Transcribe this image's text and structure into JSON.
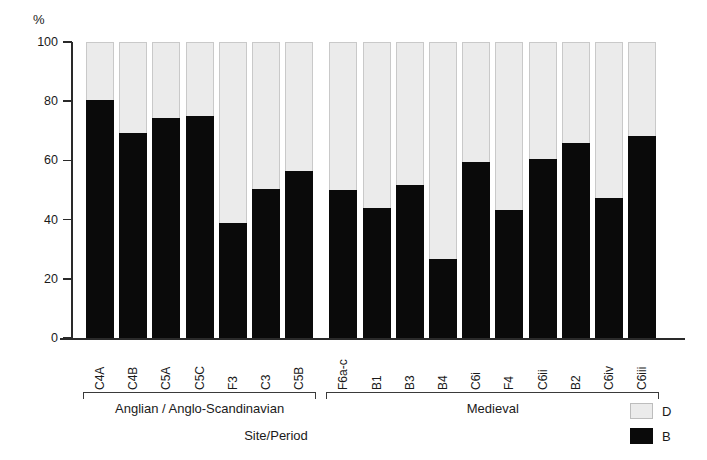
{
  "chart_data": {
    "type": "bar",
    "subtype": "stacked-percentage",
    "title": "",
    "xlabel": "Site/Period",
    "ylabel": "%",
    "ylim": [
      0,
      100
    ],
    "yticks": [
      0,
      20,
      40,
      60,
      80,
      100
    ],
    "ytick_labels": [
      "0",
      "20",
      "40",
      "60",
      "80",
      "100"
    ],
    "grid": false,
    "legend_position": "bottom-right",
    "categories": [
      "C4A",
      "C4B",
      "C5A",
      "C5C",
      "F3",
      "C3",
      "C5B",
      "F6a-c",
      "B1",
      "B3",
      "B4",
      "C6i",
      "F4",
      "C6ii",
      "B2",
      "C6iv",
      "C6iii"
    ],
    "series": [
      {
        "name": "B",
        "color": "#0a0a0a",
        "values": [
          80,
          69,
          74,
          74.5,
          38.5,
          50,
          56,
          49.5,
          43.5,
          51.5,
          26.5,
          59,
          43,
          60,
          65.5,
          47,
          68
        ]
      },
      {
        "name": "D",
        "color": "#ebebeb",
        "values": [
          20,
          31,
          26,
          25.5,
          61.5,
          50,
          44,
          50.5,
          56.5,
          48.5,
          73.5,
          41,
          57,
          40,
          34.5,
          53,
          32
        ]
      }
    ],
    "groups": [
      {
        "label": "Anglian / Anglo-Scandinavian",
        "categories": [
          "C4A",
          "C4B",
          "C5A",
          "C5C",
          "F3",
          "C3",
          "C5B"
        ]
      },
      {
        "label": "Medieval",
        "categories": [
          "F6a-c",
          "B1",
          "B3",
          "B4",
          "C6i",
          "F4",
          "C6ii",
          "B2",
          "C6iv",
          "C6iii"
        ]
      }
    ],
    "legend": [
      {
        "label": "D",
        "swatch": "light-gray"
      },
      {
        "label": "B",
        "swatch": "black"
      }
    ]
  }
}
